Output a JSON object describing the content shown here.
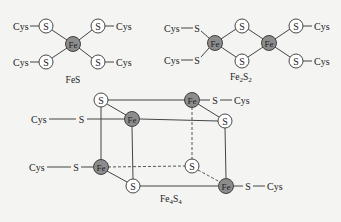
{
  "labels": {
    "fes": "FeS",
    "fe2s2_fe": "Fe",
    "fe2s2_sub2a": "2",
    "fe2s2_s": "S",
    "fe2s2_sub2b": "2",
    "fe4s4_fe": "Fe",
    "fe4s4_sub4a": "4",
    "fe4s4_s": "S",
    "fe4s4_sub4b": "4"
  },
  "atoms": {
    "fe": "Fe",
    "s": "S",
    "cys": "Cys"
  },
  "colors": {
    "fe_fill": "#8c8c8c",
    "s_fill": "#ffffff",
    "bond": "#444444",
    "background": "#f4f4f2"
  },
  "clusters": [
    {
      "name": "FeS",
      "fe_count": 1,
      "s_count": 0,
      "cys_ligands": 4
    },
    {
      "name": "Fe2S2",
      "fe_count": 2,
      "s_count": 2,
      "cys_ligands": 4
    },
    {
      "name": "Fe4S4",
      "fe_count": 4,
      "s_count": 4,
      "cys_ligands": 4
    }
  ]
}
